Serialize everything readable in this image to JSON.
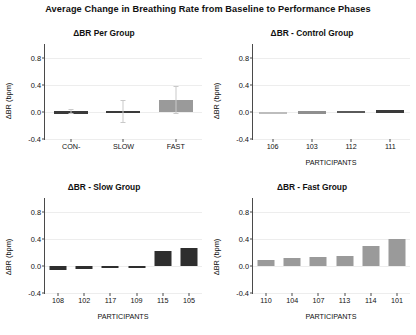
{
  "figure": {
    "title": "Average Change in Breathing Rate  from Baseline to Performance Phases",
    "background_color": "#ffffff"
  },
  "chart_data": [
    {
      "type": "bar",
      "panel": "top-left",
      "title": "ΔBR Per Group",
      "xlabel": "",
      "ylabel": "ΔBR (bpm)",
      "categories": [
        "CON-",
        "SLOW",
        "FAST"
      ],
      "values": [
        0.01,
        0.015,
        0.18
      ],
      "errors": [
        0.025,
        0.16,
        0.2
      ],
      "bar_colors": [
        "#3a3a3a",
        "#3a3a3a",
        "#9a9a9a"
      ],
      "error_color": "#c9c9c9",
      "ylim": [
        -0.4,
        1.0
      ],
      "yticks": [
        -0.4,
        0.0,
        0.4,
        0.8
      ],
      "ytick_labels": [
        "-0.4",
        "0.0",
        "0.4",
        "0.8"
      ],
      "grid": true,
      "legend": "none"
    },
    {
      "type": "bar",
      "panel": "top-right",
      "title": "ΔBR - Control Group",
      "xlabel": "PARTICIPANTS",
      "ylabel": "ΔBR (bpm)",
      "categories": [
        "106",
        "103",
        "112",
        "111"
      ],
      "values": [
        0.004,
        0.008,
        0.016,
        0.022
      ],
      "bar_colors": [
        "#bdbdbd",
        "#8f8f8f",
        "#5a5a5a",
        "#3a3a3a"
      ],
      "ylim": [
        -0.4,
        1.0
      ],
      "yticks": [
        -0.4,
        0.0,
        0.4,
        0.8
      ],
      "ytick_labels": [
        "-0.4",
        "0.0",
        "0.4",
        "0.8"
      ],
      "grid": true,
      "legend": "none"
    },
    {
      "type": "bar",
      "panel": "bottom-left",
      "title": "ΔBR - Slow Group",
      "xlabel": "PARTICIPANTS",
      "ylabel": "ΔBR (bpm)",
      "categories": [
        "108",
        "102",
        "117",
        "109",
        "115",
        "105"
      ],
      "values": [
        -0.055,
        -0.04,
        -0.025,
        -0.008,
        0.215,
        0.26
      ],
      "bar_colors": [
        "#2e2e2e",
        "#2e2e2e",
        "#2e2e2e",
        "#2e2e2e",
        "#2e2e2e",
        "#2e2e2e"
      ],
      "ylim": [
        -0.4,
        1.0
      ],
      "yticks": [
        -0.4,
        0.0,
        0.4,
        0.8
      ],
      "ytick_labels": [
        "-0.4",
        "0.0",
        "0.4",
        "0.8"
      ],
      "grid": true,
      "legend": "none"
    },
    {
      "type": "bar",
      "panel": "bottom-right",
      "title": "ΔBR - Fast Group",
      "xlabel": "PARTICIPANTS",
      "ylabel": "ΔBR (bpm)",
      "categories": [
        "110",
        "104",
        "107",
        "113",
        "114",
        "101"
      ],
      "values": [
        0.09,
        0.12,
        0.13,
        0.14,
        0.3,
        0.39
      ],
      "bar_colors": [
        "#9a9a9a",
        "#9a9a9a",
        "#9a9a9a",
        "#9a9a9a",
        "#9a9a9a",
        "#9a9a9a"
      ],
      "ylim": [
        -0.4,
        1.0
      ],
      "yticks": [
        -0.4,
        0.0,
        0.4,
        0.8
      ],
      "ytick_labels": [
        "-0.4",
        "0.0",
        "0.4",
        "0.8"
      ],
      "grid": true,
      "legend": "none"
    }
  ]
}
